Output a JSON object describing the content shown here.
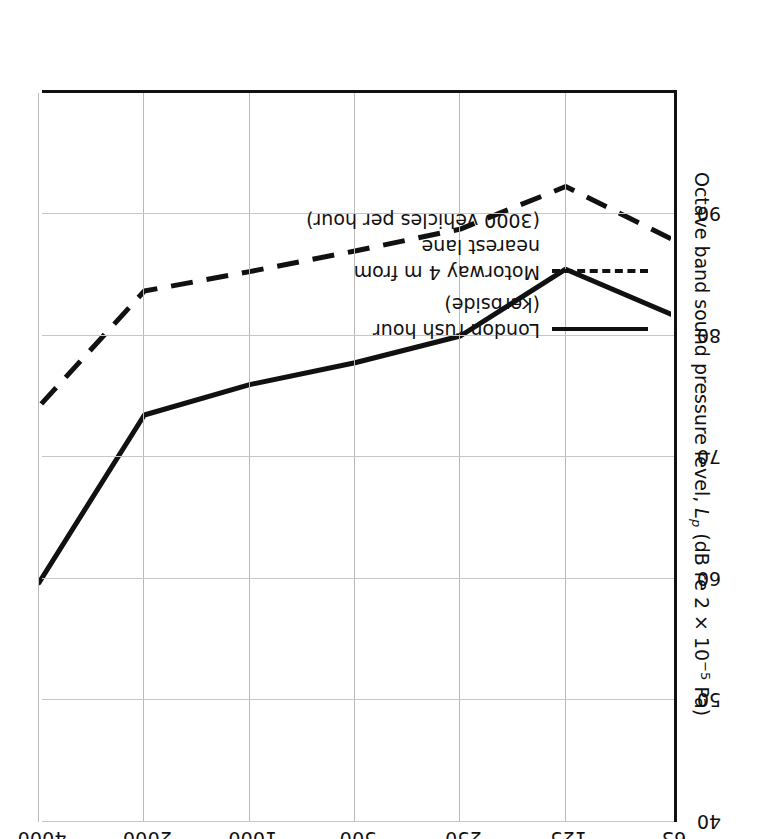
{
  "chart_data": {
    "type": "line",
    "title": "",
    "xlabel": "Frequency (Hz)",
    "ylabel": "Octave band sound pressure level, Lp (dB re 2 × 10−5 Pa)",
    "categories": [
      "63",
      "125",
      "250",
      "500",
      "1000",
      "2000",
      "4000"
    ],
    "x_tick_labels": [
      "63",
      "125",
      "250",
      "500",
      "1000",
      "2000",
      "4000"
    ],
    "y_tick_labels": [
      "40",
      "50",
      "60",
      "70",
      "80",
      "90"
    ],
    "ylim": [
      40,
      100
    ],
    "y_major_step": 10,
    "grid": true,
    "legend_position": "inside-upper-right",
    "series": [
      {
        "name": "London rush hour (kerbside)",
        "style": "solid",
        "color": "#111111",
        "values": [
          81.8,
          85.5,
          80.0,
          77.8,
          76.0,
          73.5,
          59.7
        ]
      },
      {
        "name": "Motorway 4 m from nearest lane (3000 vehicles per hour)",
        "style": "dashed",
        "color": "#111111",
        "values": [
          88.0,
          92.3,
          88.8,
          87.0,
          85.3,
          83.7,
          74.2
        ]
      }
    ]
  },
  "axes": {
    "x_title": "Frequency (Hz)",
    "y_title_main": "Octave band sound pressure level, ",
    "y_title_symbol": "L",
    "y_title_symbol_sub": "p",
    "y_title_units_a": " (dB re 2 × 10",
    "y_title_units_sup": "−5",
    "y_title_units_b": " Pa)"
  },
  "legend": {
    "items": [
      {
        "style": "solid",
        "line1": "London rush hour",
        "line2": "(kerbside)"
      },
      {
        "style": "dashed",
        "line1": "Motorway 4 m from",
        "line2": "nearest lane",
        "line3": "(3000 vehicles per hour)"
      }
    ]
  }
}
